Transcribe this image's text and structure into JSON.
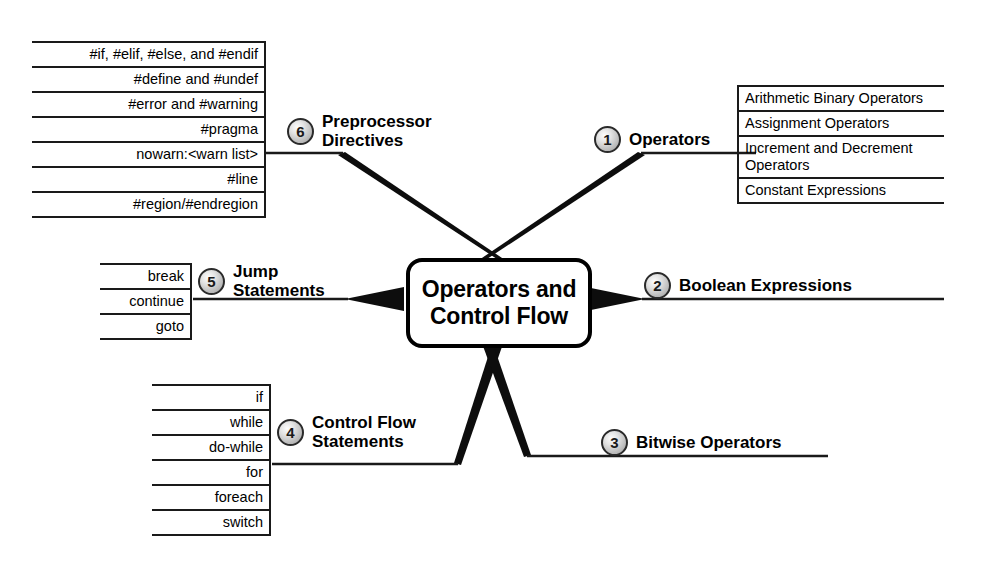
{
  "diagram": {
    "type": "mind-map",
    "center": {
      "title": "Operators and\nControl Flow"
    },
    "colors": {
      "stroke": "#1a1a1a",
      "background": "#ffffff",
      "badge_fill": "#c8c8c8",
      "text": "#000000"
    },
    "branches": [
      {
        "number": "1",
        "label": "Operators",
        "side": "right",
        "items": [
          "Arithmetic Binary\nOperators",
          "Assignment Operators",
          "Increment and\nDecrement Operators",
          "Constant Expressions"
        ]
      },
      {
        "number": "2",
        "label": "Boolean Expressions",
        "side": "right",
        "items": []
      },
      {
        "number": "3",
        "label": "Bitwise Operators",
        "side": "right",
        "items": []
      },
      {
        "number": "4",
        "label": "Control Flow\nStatements",
        "side": "left",
        "items": [
          "if",
          "while",
          "do-while",
          "for",
          "foreach",
          "switch"
        ]
      },
      {
        "number": "5",
        "label": "Jump\nStatements",
        "side": "left",
        "items": [
          "break",
          "continue",
          "goto"
        ]
      },
      {
        "number": "6",
        "label": "Preprocessor\nDirectives",
        "side": "left",
        "items": [
          "#if, #elif, #else, and #endif",
          "#define and #undef",
          "#error and #warning",
          "#pragma",
          "nowarn:<warn list>",
          "#line",
          "#region/#endregion"
        ]
      }
    ]
  }
}
